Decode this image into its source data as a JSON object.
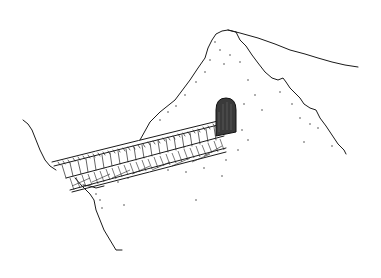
{
  "image": {
    "description": "Pen-and-ink sketch of a rope suspension bridge leading to an arched tunnel entrance in a rocky mountain",
    "style": "black line drawing on white",
    "colors": {
      "background": "#ffffff",
      "ink": "#1a1a1a"
    },
    "elements": [
      {
        "name": "mountain-peak",
        "label": "Mountain peak"
      },
      {
        "name": "rope-bridge",
        "label": "Rope suspension bridge"
      },
      {
        "name": "tunnel-entrance",
        "label": "Arched tunnel entrance"
      },
      {
        "name": "left-cliff",
        "label": "Left cliff edge"
      }
    ]
  }
}
